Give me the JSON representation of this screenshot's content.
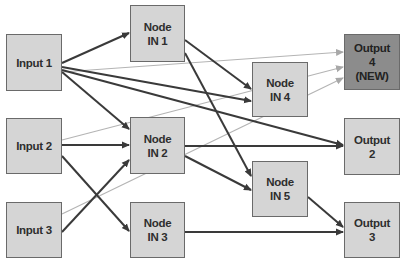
{
  "diagram": {
    "nodes": {
      "input1": {
        "label": "Input 1",
        "x": 6,
        "y": 34,
        "w": 56,
        "h": 57
      },
      "input2": {
        "label": "Input 2",
        "x": 6,
        "y": 118,
        "w": 56,
        "h": 56
      },
      "input3": {
        "label": "Input 3",
        "x": 6,
        "y": 202,
        "w": 56,
        "h": 56
      },
      "in1": {
        "label": "Node\nIN 1",
        "x": 130,
        "y": 5,
        "w": 55,
        "h": 57
      },
      "in2": {
        "label": "Node\nIN 2",
        "x": 130,
        "y": 117,
        "w": 55,
        "h": 57
      },
      "in3": {
        "label": "Node\nIN 3",
        "x": 130,
        "y": 202,
        "w": 55,
        "h": 56
      },
      "in4": {
        "label": "Node\nIN 4",
        "x": 252,
        "y": 62,
        "w": 56,
        "h": 55
      },
      "in5": {
        "label": "Node\nIN 5",
        "x": 252,
        "y": 161,
        "w": 56,
        "h": 56
      },
      "out2": {
        "label": "Output\n2",
        "x": 344,
        "y": 118,
        "w": 56,
        "h": 57
      },
      "out3": {
        "label": "Output\n3",
        "x": 344,
        "y": 202,
        "w": 56,
        "h": 56
      },
      "out4": {
        "label": "Output\n4\n(NEW)",
        "x": 344,
        "y": 34,
        "w": 56,
        "h": 56
      }
    },
    "colors": {
      "node_fill": "#d5d5d5",
      "new_node_fill": "#8c8c8c",
      "edge_dark": "#3a3a3a",
      "edge_light": "#b0b0b0"
    },
    "edges": [
      {
        "from": "Input 1",
        "to": "Node IN 1",
        "style": "dark"
      },
      {
        "from": "Input 1",
        "to": "Node IN 2",
        "style": "dark"
      },
      {
        "from": "Input 1",
        "to": "Node IN 4",
        "style": "dark"
      },
      {
        "from": "Input 1",
        "to": "Output 2",
        "style": "dark"
      },
      {
        "from": "Input 1",
        "to": "Output 4 (NEW)",
        "style": "light"
      },
      {
        "from": "Input 2",
        "to": "Node IN 2",
        "style": "dark"
      },
      {
        "from": "Input 2",
        "to": "Node IN 3",
        "style": "dark"
      },
      {
        "from": "Input 2",
        "to": "Output 4 (NEW)",
        "style": "light"
      },
      {
        "from": "Input 3",
        "to": "Node IN 2",
        "style": "dark"
      },
      {
        "from": "Input 3",
        "to": "Output 4 (NEW)",
        "style": "light"
      },
      {
        "from": "Node IN 1",
        "to": "Node IN 4",
        "style": "dark"
      },
      {
        "from": "Node IN 1",
        "to": "Node IN 5",
        "style": "dark"
      },
      {
        "from": "Node IN 2",
        "to": "Output 2",
        "style": "dark"
      },
      {
        "from": "Node IN 2",
        "to": "Node IN 5",
        "style": "dark"
      },
      {
        "from": "Node IN 3",
        "to": "Output 3",
        "style": "dark"
      },
      {
        "from": "Node IN 5",
        "to": "Output 3",
        "style": "dark"
      }
    ]
  }
}
